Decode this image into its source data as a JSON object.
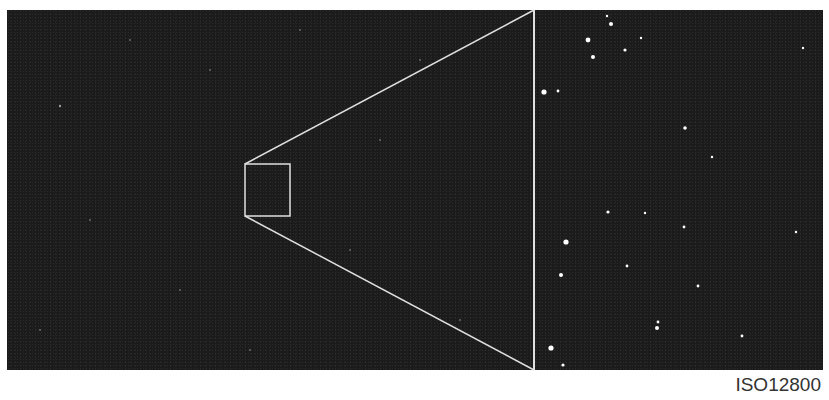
{
  "figure": {
    "caption": "ISO12800",
    "colors": {
      "background": "#1b1b1b",
      "frame_line": "#e0e0e0",
      "page": "#ffffff"
    },
    "wide_view": {
      "zoom_box": {
        "x": 245,
        "y": 164,
        "w": 45,
        "h": 52
      }
    },
    "inset_view": {
      "x": 534,
      "y": 10,
      "w": 289,
      "h": 360
    }
  }
}
